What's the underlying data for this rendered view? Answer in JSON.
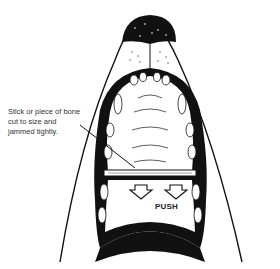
{
  "figure": {
    "caption_lines": [
      "Stick or piece of bone",
      "cut to size and",
      "jammed tightly."
    ],
    "push_label": "PUSH",
    "colors": {
      "ink": "#111111",
      "background": "#ffffff",
      "text": "#333333"
    }
  }
}
